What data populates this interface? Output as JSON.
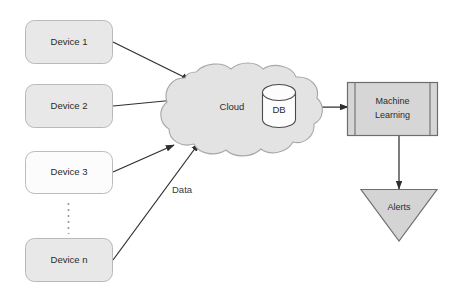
{
  "diagram": {
    "background_color": "#ffffff",
    "nodes": {
      "device_1": {
        "label": "Device 1",
        "shape": "rounded-rectangle",
        "fill": "#e8e8e8"
      },
      "device_2": {
        "label": "Device 2",
        "shape": "rounded-rectangle",
        "fill": "#e8e8e8"
      },
      "device_3": {
        "label": "Device 3",
        "shape": "rounded-rectangle",
        "fill": "#fcfcfc"
      },
      "device_n": {
        "label": "Device n",
        "shape": "rounded-rectangle",
        "fill": "#e8e8e8"
      },
      "cloud": {
        "label": "Cloud",
        "shape": "cloud",
        "fill": "#e3e3e3"
      },
      "database": {
        "label": "DB",
        "shape": "cylinder",
        "fill": "#fdfdfd"
      },
      "machine_learning": {
        "label_line1": "Machine",
        "label_line2": "Learning",
        "shape": "predefined-process",
        "fill": "#d6d6d6"
      },
      "alerts": {
        "label": "Alerts",
        "shape": "triangle-down",
        "fill": "#d4d4d4"
      }
    },
    "edges": {
      "device_1_to_cloud": {
        "label": ""
      },
      "device_2_to_cloud": {
        "label": ""
      },
      "device_3_to_cloud": {
        "label": ""
      },
      "device_n_to_cloud": {
        "label": "Data"
      },
      "db_to_machine_learning": {
        "label": ""
      },
      "machine_learning_to_alerts": {
        "label": ""
      }
    },
    "ellipsis": {
      "label": "vertical-dots"
    }
  }
}
